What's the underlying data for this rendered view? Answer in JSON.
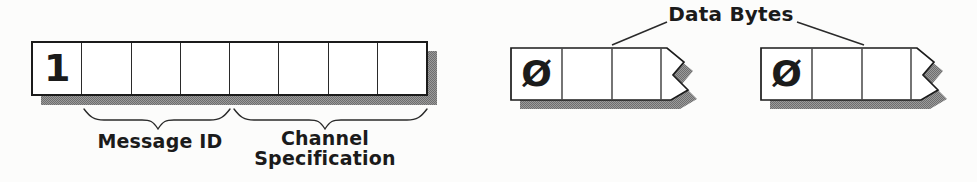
{
  "status_byte": {
    "cells": [
      "1",
      "",
      "",
      "",
      "",
      "",
      "",
      ""
    ],
    "brace_labels": {
      "message_id": "Message ID",
      "channel_line1": "Channel",
      "channel_line2": "Specification"
    }
  },
  "data_bytes": {
    "label": "Data Bytes",
    "bytes": [
      {
        "bit0": "Ø"
      },
      {
        "bit0": "Ø"
      }
    ]
  },
  "colors": {
    "ink": "#1b1b1b",
    "shadow_dark": "#6e6e6e",
    "shadow_light": "#9b9b9b",
    "box_fill": "#ffffff",
    "background": "#fcfcfb"
  }
}
